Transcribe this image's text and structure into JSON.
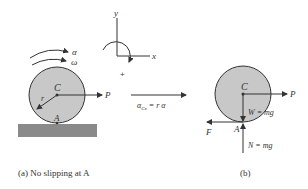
{
  "figure_a": {
    "labels": {
      "alpha": "α",
      "omega": "ω",
      "center": "C",
      "radius": "r",
      "contact": "A",
      "force": "P"
    },
    "caption": "(a) No slipping at A"
  },
  "axes": {
    "y_label": "y",
    "x_label": "x",
    "positive_sign": "+"
  },
  "kinematic_relation": {
    "text": "α",
    "subscript": "Cx",
    "equation": "= r α"
  },
  "figure_b": {
    "labels": {
      "center": "C",
      "force": "P",
      "weight": "W = mg",
      "contact": "A",
      "friction": "F",
      "normal": "N = mg"
    },
    "caption": "(b)"
  },
  "colors": {
    "disk_fill": "#c8c8c8",
    "ground_fill": "#8a8a8a",
    "line": "#333333"
  }
}
